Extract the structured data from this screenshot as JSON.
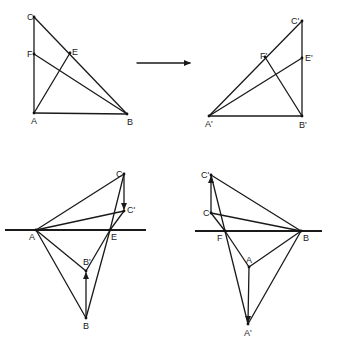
{
  "figure": {
    "panels": [
      {
        "id": "top-left",
        "points": {
          "C": [
            34,
            17
          ],
          "F": [
            34,
            54
          ],
          "E": [
            70,
            53
          ],
          "A": [
            34,
            113
          ],
          "B": [
            127,
            114
          ]
        },
        "labels": {
          "C": "C",
          "F": "F",
          "E": "E",
          "A": "A",
          "B": "B"
        }
      },
      {
        "id": "top-right",
        "points": {
          "C'": [
            302,
            21
          ],
          "F'": [
            265,
            57
          ],
          "E'": [
            302,
            58
          ],
          "A'": [
            209,
            116
          ],
          "B'": [
            302,
            116
          ]
        },
        "labels": {
          "C": "C'",
          "F": "F'",
          "E": "E'",
          "A": "A'",
          "B": "B'"
        }
      },
      {
        "id": "bottom-left",
        "line_y": 230,
        "points": {
          "C": [
            124,
            174
          ],
          "C'": [
            124,
            211
          ],
          "A": [
            36,
            230
          ],
          "E": [
            110,
            230
          ],
          "B'": [
            86,
            271
          ],
          "B": [
            86,
            318
          ]
        },
        "labels": {
          "C": "C",
          "Cp": "C'",
          "A": "A",
          "E": "E",
          "Bp": "B'",
          "B": "B"
        }
      },
      {
        "id": "bottom-right",
        "line_y": 231,
        "points": {
          "C'": [
            211,
            175
          ],
          "C": [
            211,
            213
          ],
          "F": [
            225,
            231
          ],
          "B": [
            301,
            231
          ],
          "A": [
            249,
            267
          ],
          "A'": [
            248,
            324
          ]
        },
        "labels": {
          "Cp": "C'",
          "C": "C",
          "F": "F",
          "B": "B",
          "A": "A",
          "Ap": "A'"
        }
      }
    ],
    "transform_arrow": {
      "from": [
        137,
        63
      ],
      "to": [
        192,
        63
      ]
    },
    "colors": {
      "stroke": "#1a1a1a",
      "background": "#ffffff"
    }
  }
}
